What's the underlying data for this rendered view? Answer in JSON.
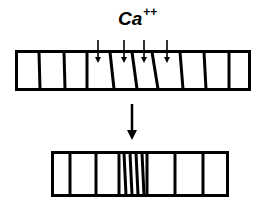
{
  "diagram": {
    "ion_label": "Ca",
    "ion_charge": "++",
    "top_bar": {
      "description": "relaxed sarcomere segment with calcium influx",
      "segments": 11,
      "influx_arrows": 4
    },
    "transition_arrow": "down",
    "bottom_bar": {
      "description": "contracted segment with compressed bands",
      "compressed_lines": 5
    },
    "colors": {
      "stroke": "#000000",
      "background": "#ffffff"
    }
  }
}
